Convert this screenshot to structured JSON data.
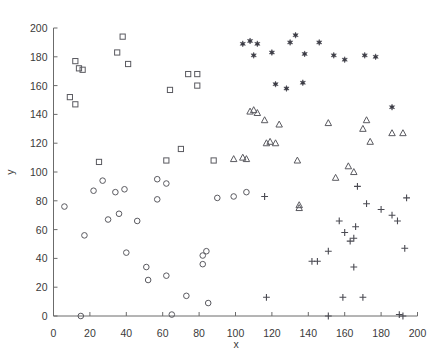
{
  "chart_data": {
    "type": "scatter",
    "title": "",
    "xlabel": "x",
    "ylabel": "y",
    "xlim": [
      0,
      200
    ],
    "ylim": [
      0,
      200
    ],
    "xticks": [
      0,
      20,
      40,
      60,
      80,
      100,
      120,
      140,
      160,
      180,
      200
    ],
    "yticks": [
      0,
      20,
      40,
      60,
      80,
      100,
      120,
      140,
      160,
      180,
      200
    ],
    "grid": false,
    "legend": "none",
    "series": [
      {
        "name": "squares",
        "marker": "square-open",
        "color": "#5a5a60",
        "points": [
          [
            12,
            177
          ],
          [
            14,
            172
          ],
          [
            16,
            171
          ],
          [
            9,
            152
          ],
          [
            12,
            147
          ],
          [
            38,
            194
          ],
          [
            35,
            183
          ],
          [
            41,
            175
          ],
          [
            64,
            157
          ],
          [
            74,
            168
          ],
          [
            79,
            168
          ],
          [
            79,
            160
          ],
          [
            70,
            116
          ],
          [
            25,
            107
          ],
          [
            62,
            108
          ],
          [
            88,
            108
          ]
        ]
      },
      {
        "name": "circles",
        "marker": "circle-open",
        "color": "#5a5a60",
        "points": [
          [
            6,
            76
          ],
          [
            17,
            56
          ],
          [
            22,
            87
          ],
          [
            27,
            94
          ],
          [
            30,
            67
          ],
          [
            34,
            86
          ],
          [
            36,
            71
          ],
          [
            39,
            88
          ],
          [
            40,
            44
          ],
          [
            46,
            66
          ],
          [
            51,
            34
          ],
          [
            52,
            25
          ],
          [
            57,
            81
          ],
          [
            57,
            95
          ],
          [
            62,
            92
          ],
          [
            62,
            28
          ],
          [
            65,
            1
          ],
          [
            73,
            14
          ],
          [
            82,
            36
          ],
          [
            82,
            42
          ],
          [
            84,
            45
          ],
          [
            85,
            9
          ],
          [
            90,
            82
          ],
          [
            15,
            0
          ],
          [
            99,
            83
          ],
          [
            106,
            86
          ]
        ]
      },
      {
        "name": "triangles",
        "marker": "triangle-open",
        "color": "#5a5a60",
        "points": [
          [
            99,
            109
          ],
          [
            104,
            110
          ],
          [
            106,
            109
          ],
          [
            108,
            142
          ],
          [
            110,
            143
          ],
          [
            112,
            141
          ],
          [
            116,
            136
          ],
          [
            117,
            120
          ],
          [
            119,
            121
          ],
          [
            122,
            120
          ],
          [
            124,
            133
          ],
          [
            134,
            108
          ],
          [
            135,
            75
          ],
          [
            135,
            77
          ],
          [
            151,
            134
          ],
          [
            155,
            96
          ],
          [
            162,
            104
          ],
          [
            165,
            100
          ],
          [
            170,
            130
          ],
          [
            172,
            136
          ],
          [
            174,
            121
          ],
          [
            186,
            127
          ],
          [
            192,
            127
          ]
        ]
      },
      {
        "name": "plus",
        "marker": "plus",
        "color": "#4a4a52",
        "points": [
          [
            116,
            83
          ],
          [
            117,
            13
          ],
          [
            142,
            38
          ],
          [
            145,
            38
          ],
          [
            151,
            45
          ],
          [
            151,
            0
          ],
          [
            157,
            66
          ],
          [
            159,
            13
          ],
          [
            160,
            58
          ],
          [
            163,
            52
          ],
          [
            165,
            54
          ],
          [
            165,
            34
          ],
          [
            166,
            62
          ],
          [
            167,
            90
          ],
          [
            170,
            13
          ],
          [
            172,
            78
          ],
          [
            180,
            74
          ],
          [
            186,
            70
          ],
          [
            189,
            66
          ],
          [
            190,
            1
          ],
          [
            192,
            0
          ],
          [
            193,
            47
          ],
          [
            194,
            82
          ]
        ]
      },
      {
        "name": "stars",
        "marker": "hexagram-filled",
        "color": "#3b3b44",
        "points": [
          [
            104,
            189
          ],
          [
            108,
            191
          ],
          [
            112,
            189
          ],
          [
            110,
            181
          ],
          [
            120,
            183
          ],
          [
            122,
            161
          ],
          [
            128,
            158
          ],
          [
            130,
            190
          ],
          [
            133,
            195
          ],
          [
            138,
            182
          ],
          [
            137,
            162
          ],
          [
            146,
            190
          ],
          [
            154,
            181
          ],
          [
            160,
            178
          ],
          [
            171,
            181
          ],
          [
            177,
            180
          ],
          [
            186,
            145
          ]
        ]
      }
    ]
  },
  "axes": {
    "x_title": "x",
    "y_title": "y",
    "x_tick_labels": [
      "0",
      "20",
      "40",
      "60",
      "80",
      "100",
      "120",
      "140",
      "160",
      "180",
      "200"
    ],
    "y_tick_labels": [
      "0",
      "20",
      "40",
      "60",
      "80",
      "100",
      "120",
      "140",
      "160",
      "180",
      "200"
    ]
  },
  "colors": {
    "axis": "#6b6b6b",
    "text": "#3a3a3a",
    "marker_open": "#5a5a60",
    "marker_filled": "#3b3b44",
    "background": "#ffffff"
  }
}
